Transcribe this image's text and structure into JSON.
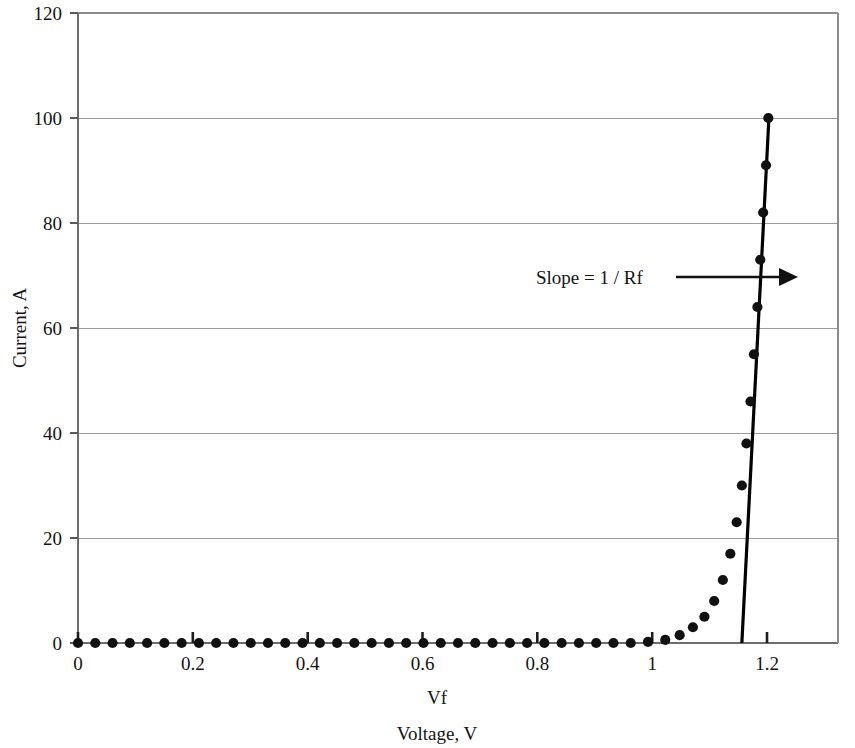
{
  "chart_data": {
    "type": "scatter",
    "title": "",
    "subtitle": "",
    "xlabel": "Voltage, V",
    "xlabel_secondary": "Vf",
    "ylabel": "Current, A",
    "xlim": [
      0,
      1.32
    ],
    "ylim": [
      0,
      120
    ],
    "xticks": [
      0,
      0.2,
      0.4,
      0.6,
      0.8,
      1,
      1.2
    ],
    "xtick_labels": [
      "0",
      "0.2",
      "0.4",
      "0.6",
      "0.8",
      "1",
      "1.2"
    ],
    "yticks": [
      0,
      20,
      40,
      60,
      80,
      100,
      120
    ],
    "ytick_labels": [
      "0",
      "20",
      "40",
      "60",
      "80",
      "100",
      "120"
    ],
    "grid": "horizontal",
    "legend": "none",
    "marker": "filled-circle",
    "marker_color": "#111111",
    "series": [
      {
        "name": "Diode forward characteristic",
        "x": [
          0.0,
          0.03,
          0.06,
          0.09,
          0.12,
          0.15,
          0.18,
          0.21,
          0.24,
          0.27,
          0.3,
          0.33,
          0.36,
          0.39,
          0.42,
          0.45,
          0.48,
          0.51,
          0.54,
          0.57,
          0.6,
          0.63,
          0.66,
          0.69,
          0.72,
          0.75,
          0.78,
          0.81,
          0.84,
          0.87,
          0.9,
          0.93,
          0.96,
          0.99,
          1.02,
          1.045,
          1.068,
          1.088,
          1.105,
          1.12,
          1.133,
          1.144,
          1.153,
          1.161,
          1.168,
          1.174,
          1.18,
          1.185,
          1.19,
          1.195,
          1.199
        ],
        "y": [
          0.0,
          0.0,
          0.0,
          0.0,
          0.0,
          0.0,
          0.0,
          0.0,
          0.0,
          0.0,
          0.0,
          0.0,
          0.0,
          0.0,
          0.0,
          0.0,
          0.0,
          0.0,
          0.0,
          0.0,
          0.0,
          0.0,
          0.0,
          0.0,
          0.0,
          0.0,
          0.0,
          0.0,
          0.0,
          0.0,
          0.0,
          0.0,
          0.0,
          0.2,
          0.6,
          1.5,
          3.0,
          5.0,
          8.0,
          12.0,
          17.0,
          23.0,
          30.0,
          38.0,
          46.0,
          55.0,
          64.0,
          73.0,
          82.0,
          91.0,
          100.0
        ]
      }
    ],
    "tangent_line": {
      "name": "Slope = 1 / Rf",
      "x_intercept": 1.153,
      "x_top": 1.2,
      "y_top": 100
    },
    "annotations": [
      {
        "name": "slope-annotation",
        "text": "Slope = 1 / Rf",
        "arrow": true,
        "points_to_x": 1.185,
        "at_y": 70
      }
    ]
  },
  "axes": {
    "y_title": "Current, A",
    "x_title_primary": "Vf",
    "x_title_secondary": "Voltage, V"
  },
  "annotation": {
    "slope_label": "Slope = 1 / Rf"
  },
  "ticks": {
    "y": [
      "120",
      "100",
      "80",
      "60",
      "40",
      "20",
      "0"
    ],
    "x": [
      "0",
      "0.2",
      "0.4",
      "0.6",
      "0.8",
      "1",
      "1.2"
    ]
  }
}
